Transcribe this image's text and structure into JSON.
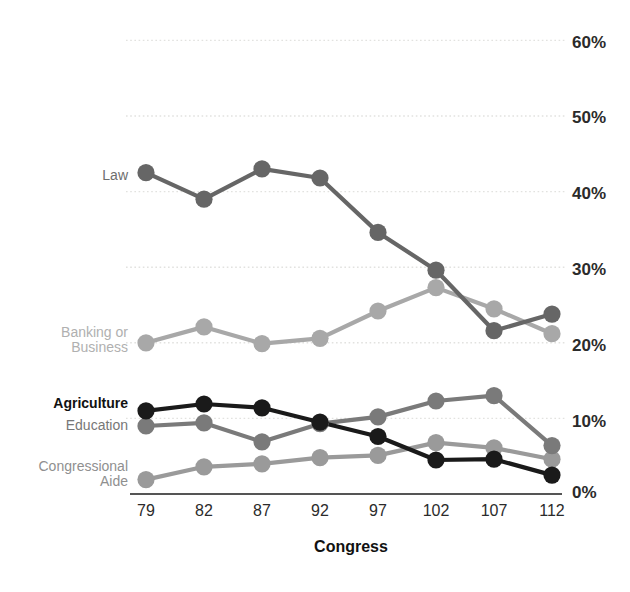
{
  "chart_data": {
    "type": "line",
    "title": "",
    "subtitle": "",
    "xlabel": "Congress",
    "ylabel": "",
    "categories": [
      "79",
      "82",
      "87",
      "92",
      "97",
      "102",
      "107",
      "112"
    ],
    "x": [
      79,
      82,
      87,
      92,
      97,
      102,
      107,
      112
    ],
    "ylim": [
      0,
      60
    ],
    "yticks": [
      0,
      10,
      20,
      30,
      40,
      50,
      60
    ],
    "ytick_labels": [
      "0%",
      "10%",
      "20%",
      "30%",
      "40%",
      "50%",
      "60%"
    ],
    "grid": true,
    "grid_style": "dotted-horizontal",
    "legend_position": "inline-left-labels",
    "series": [
      {
        "name": "Law",
        "label": "Law",
        "color": "#666666",
        "label_color": "#6d6d6d",
        "label_bold": false,
        "values": [
          42.5,
          39.0,
          43.0,
          41.8,
          34.6,
          29.6,
          21.6,
          23.8
        ]
      },
      {
        "name": "Banking or Business",
        "label": "Banking or\nBusiness",
        "color": "#a8a8a8",
        "label_color": "#b0b0b0",
        "label_bold": false,
        "values": [
          20.0,
          22.1,
          19.9,
          20.6,
          24.2,
          27.3,
          24.5,
          21.2
        ]
      },
      {
        "name": "Agriculture",
        "label": "Agriculture",
        "color": "#1a1a1a",
        "label_color": "#111111",
        "label_bold": true,
        "values": [
          11.0,
          11.9,
          11.4,
          9.5,
          7.6,
          4.5,
          4.6,
          2.5
        ]
      },
      {
        "name": "Education",
        "label": "Education",
        "color": "#7a7a7a",
        "label_color": "#777777",
        "label_bold": false,
        "values": [
          9.0,
          9.4,
          6.9,
          9.3,
          10.2,
          12.3,
          13.0,
          6.4
        ]
      },
      {
        "name": "Congressional Aide",
        "label": "Congressional\nAide",
        "color": "#9a9a9a",
        "label_color": "#8f8f8f",
        "label_bold": false,
        "values": [
          1.9,
          3.6,
          4.0,
          4.8,
          5.1,
          6.8,
          6.1,
          4.6
        ]
      }
    ],
    "axis_line_color": "#555555",
    "grid_color": "#e2e2df",
    "background": "#ffffff"
  },
  "labels": {
    "law": "Law",
    "banking": "Banking or\nBusiness",
    "agriculture": "Agriculture",
    "education": "Education",
    "congressional_aide": "Congressional\nAide",
    "xaxis_title": "Congress",
    "y60": "60%",
    "y50": "50%",
    "y40": "40%",
    "y30": "30%",
    "y20": "20%",
    "y10": "10%",
    "y0": "0%",
    "x79": "79",
    "x82": "82",
    "x87": "87",
    "x92": "92",
    "x97": "97",
    "x102": "102",
    "x107": "107",
    "x112": "112"
  }
}
